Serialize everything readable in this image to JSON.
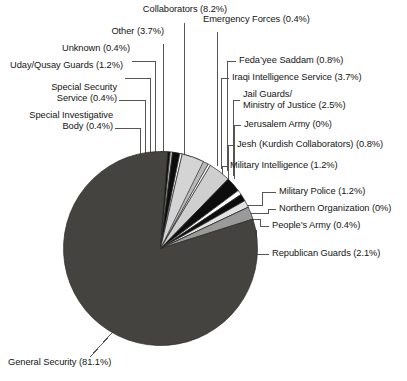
{
  "chart_data": {
    "type": "pie",
    "title": "",
    "subtitle": "",
    "xlabel": "",
    "ylabel": "",
    "legend_position": "callout-labels",
    "grid": false,
    "value_unit": "percent",
    "categories": [
      "Collaborators",
      "Emergency Forces",
      "Feda'yee Saddam",
      "Iraqi Intelligence Service",
      "Jail Guards/ Ministry of Justice",
      "Jerusalem Army",
      "Jesh (Kurdish Collaborators)",
      "Military Intelligence",
      "Military Police",
      "Northern Organization",
      "People's Army",
      "Republican Guards",
      "General Security",
      "Special Investigative Body",
      "Special Security Service",
      "Uday/Qusay Guards",
      "Unknown",
      "Other"
    ],
    "values": [
      8.2,
      0.4,
      0.8,
      3.7,
      2.5,
      0,
      0.8,
      1.2,
      1.2,
      0,
      0.4,
      2.1,
      81.1,
      0.4,
      0.4,
      1.2,
      0.4,
      3.7
    ],
    "slices": [
      {
        "name": "Collaborators",
        "percent": 8.2,
        "percent_text": "8.2%",
        "color": "#b9b9b9"
      },
      {
        "name": "Emergency Forces",
        "percent": 0.4,
        "percent_text": "0.4%",
        "color": "#ffffff"
      },
      {
        "name": "Feda'yee Saddam",
        "percent": 0.8,
        "percent_text": "0.8%",
        "color": "#6e6e6e"
      },
      {
        "name": "Iraqi Intelligence Service",
        "percent": 3.7,
        "percent_text": "3.7%",
        "color": "#cfcfcf"
      },
      {
        "name": "Jail Guards/ Ministry of Justice",
        "percent": 2.5,
        "percent_text": "2.5%",
        "color": "#0d0d0d"
      },
      {
        "name": "Jerusalem Army",
        "percent": 0,
        "percent_text": "0%",
        "color": "#ffffff"
      },
      {
        "name": "Jesh (Kurdish Collaborators)",
        "percent": 0.8,
        "percent_text": "0.8%",
        "color": "#ffffff"
      },
      {
        "name": "Military Intelligence",
        "percent": 1.2,
        "percent_text": "1.2%",
        "color": "#0d0d0d"
      },
      {
        "name": "Military Police",
        "percent": 1.2,
        "percent_text": "1.2%",
        "color": "#e2e2e2"
      },
      {
        "name": "Northern Organization",
        "percent": 0,
        "percent_text": "0%",
        "color": "#ffffff"
      },
      {
        "name": "People's Army",
        "percent": 0.4,
        "percent_text": "0.4%",
        "color": "#0d0d0d"
      },
      {
        "name": "Republican Guards",
        "percent": 2.1,
        "percent_text": "2.1%",
        "color": "#9a9a9a"
      },
      {
        "name": "General Security",
        "percent": 81.1,
        "percent_text": "81.1%",
        "color": "#454340"
      },
      {
        "name": "Special Investigative Body",
        "percent": 0.4,
        "percent_text": "0.4%",
        "color": "#0d0d0d"
      },
      {
        "name": "Special Security Service",
        "percent": 0.4,
        "percent_text": "0.4%",
        "color": "#bdbdbd"
      },
      {
        "name": "Uday/Qusay Guards",
        "percent": 1.2,
        "percent_text": "1.2%",
        "color": "#0d0d0d"
      },
      {
        "name": "Unknown",
        "percent": 0.4,
        "percent_text": "0.4%",
        "color": "#ffffff"
      },
      {
        "name": "Other",
        "percent": 3.7,
        "percent_text": "3.7%",
        "color": "#d4d4d4"
      }
    ]
  },
  "labels": {
    "collaborators": "Collaborators (8.2%)",
    "other": "Other (3.7%)",
    "unknown": "Unknown (0.4%)",
    "uday_qusay_guards": "Uday/Qusay Guards (1.2%)",
    "special_security_service_l1": "Special Security",
    "special_security_service_l2": "Service (0.4%)",
    "special_investigative_body_l1": "Special Investigative",
    "special_investigative_body_l2": "Body (0.4%)",
    "emergency_forces": "Emergency Forces (0.4%)",
    "fedayee_saddam": "Feda’yee Saddam (0.8%)",
    "iraqi_intelligence_service": "Iraqi Intelligence Service (3.7%)",
    "jail_guards_l1": "Jail Guards/",
    "jail_guards_l2": "Ministry of Justice (2.5%)",
    "jerusalem_army": "Jerusalem Army (0%)",
    "jesh_kurdish_collaborators": "Jesh (Kurdish Collaborators) (0.8%)",
    "military_intelligence": "Military Intelligence (1.2%)",
    "military_police": "Military Police (1.2%)",
    "northern_organization": "Northern Organization (0%)",
    "peoples_army": "People’s Army (0.4%)",
    "republican_guards": "Republican Guards (2.1%)",
    "general_security": "General Security (81.1%)"
  },
  "colors": {
    "background": "#ffffff",
    "text": "#141414",
    "leader_line": "#555555",
    "slice_outline": "#2a2a2a",
    "dominant_slice": "#454340"
  }
}
